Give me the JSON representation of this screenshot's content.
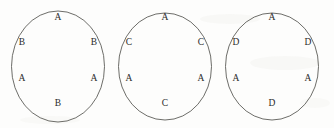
{
  "figure": {
    "type": "diagram",
    "background_color": "#fdfdfc",
    "stroke_color": "#5c5c58",
    "text_color": "#2b2b29",
    "seat_positions": [
      "top",
      "upper-left",
      "upper-right",
      "lower-left",
      "lower-right",
      "bottom"
    ],
    "circles": [
      {
        "id": "circle-1",
        "letters": {
          "top": "A",
          "upper_left": "B",
          "upper_right": "B",
          "lower_left": "A",
          "lower_right": "A",
          "bottom": "B"
        }
      },
      {
        "id": "circle-2",
        "letters": {
          "top": "A",
          "upper_left": "C",
          "upper_right": "C",
          "lower_left": "A",
          "lower_right": "A",
          "bottom": "C"
        }
      },
      {
        "id": "circle-3",
        "letters": {
          "top": "A",
          "upper_left": "D",
          "upper_right": "D",
          "lower_left": "A",
          "lower_right": "A",
          "bottom": "D"
        }
      }
    ]
  }
}
